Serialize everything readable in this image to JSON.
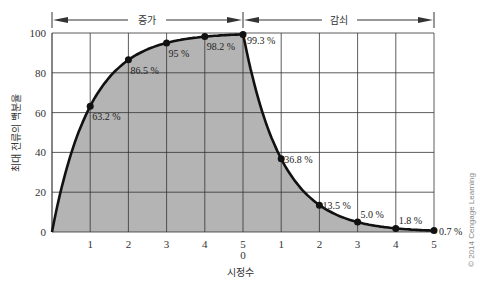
{
  "chart_data": {
    "type": "line",
    "title": "",
    "xlabel": "시정수",
    "ylabel": "최대 전류의 백분율",
    "ylim": [
      0,
      100
    ],
    "yticks": [
      0,
      20,
      40,
      60,
      80,
      100
    ],
    "grid": true,
    "regions": [
      {
        "label": "증가",
        "x_ticks": [
          "1",
          "2",
          "3",
          "4",
          "5"
        ]
      },
      {
        "label": "감쇠",
        "x_ticks": [
          "0",
          "1",
          "2",
          "3",
          "4",
          "5"
        ]
      }
    ],
    "series": [
      {
        "name": "증가",
        "x": [
          0,
          1,
          2,
          3,
          4,
          5
        ],
        "values": [
          0,
          63.2,
          86.5,
          95,
          98.2,
          99.3
        ],
        "labels": [
          "",
          "63.2 %",
          "86.5 %",
          "95 %",
          "98.2 %",
          "99.3 %"
        ]
      },
      {
        "name": "감쇠",
        "x": [
          0,
          1,
          2,
          3,
          4,
          5
        ],
        "values": [
          99.3,
          36.8,
          13.5,
          5.0,
          1.8,
          0.7
        ],
        "labels": [
          "",
          "36.8 %",
          "13.5 %",
          "5.0 %",
          "1.8 %",
          "0.7 %"
        ]
      }
    ],
    "fill_color": "#b4b4b4",
    "line_color": "#111111",
    "copyright": "© 2014 Cengage Learning"
  }
}
